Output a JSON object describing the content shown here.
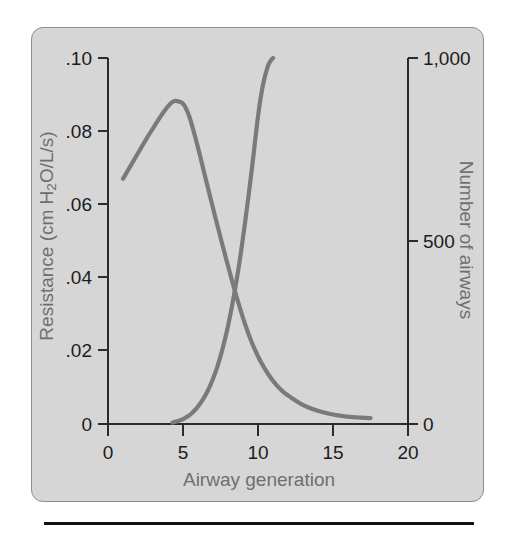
{
  "figure": {
    "panel_background": "#d6d6d6",
    "panel_border_color": "#8d8d8d",
    "curve_color": "#7a7a7a",
    "axis_color": "#2b2b2b",
    "label_color": "#6f6f6f"
  },
  "chart_data": {
    "type": "line",
    "title": "",
    "subtitle": "",
    "xlabel": "Airway generation",
    "ylabel": "Resistance (cm H2O/L/s)",
    "y2label": "Number of airways",
    "xlim": [
      0,
      20
    ],
    "ylim": [
      0,
      0.1
    ],
    "y2lim": [
      0,
      1000
    ],
    "grid": false,
    "legend": "none",
    "xticks": [
      0,
      5,
      10,
      15,
      20
    ],
    "xticklabels": [
      "0",
      "5",
      "10",
      "15",
      "20"
    ],
    "yticks": [
      0,
      0.02,
      0.04,
      0.06,
      0.08,
      0.1
    ],
    "yticklabels": [
      "0",
      ".02",
      ".04",
      ".06",
      ".08",
      ".10"
    ],
    "y2ticks": [
      0,
      500,
      1000
    ],
    "y2ticklabels": [
      "0",
      "500",
      "1,000"
    ],
    "series": [
      {
        "name": "Resistance",
        "axis": "left",
        "units": "cm H2O/L/s",
        "x": [
          1.0,
          1.5,
          2.0,
          2.5,
          3.0,
          3.5,
          4.0,
          4.4,
          4.8,
          5.0,
          5.2,
          5.5,
          6.0,
          6.5,
          7.0,
          7.5,
          8.0,
          8.5,
          9.0,
          9.5,
          10.0,
          10.5,
          11.0,
          11.5,
          12.0,
          13.0,
          14.0,
          15.0,
          16.0,
          17.0,
          17.5
        ],
        "y": [
          0.067,
          0.0705,
          0.074,
          0.0775,
          0.0808,
          0.084,
          0.0868,
          0.0882,
          0.088,
          0.0875,
          0.0862,
          0.083,
          0.0755,
          0.0672,
          0.059,
          0.051,
          0.0432,
          0.0358,
          0.029,
          0.0232,
          0.0185,
          0.0148,
          0.0118,
          0.0095,
          0.0078,
          0.0052,
          0.0036,
          0.0026,
          0.002,
          0.0017,
          0.0016
        ]
      },
      {
        "name": "Number of airways",
        "axis": "right",
        "units": "airways",
        "x": [
          4.3,
          4.8,
          5.2,
          5.6,
          6.0,
          6.4,
          6.8,
          7.2,
          7.6,
          8.0,
          8.4,
          8.8,
          9.2,
          9.6,
          10.0,
          10.3,
          10.6,
          10.8,
          11.0
        ],
        "y": [
          4,
          10,
          18,
          30,
          48,
          72,
          104,
          146,
          200,
          268,
          352,
          452,
          570,
          700,
          840,
          920,
          970,
          990,
          1000
        ]
      }
    ],
    "annotations": [
      {
        "text": "curves cross near generation 9",
        "x": 9.0,
        "y_left": 0.0225,
        "y_right": 225
      }
    ]
  },
  "axes": {
    "x": {
      "label": "Airway generation",
      "ticks": [
        "0",
        "5",
        "10",
        "15",
        "20"
      ]
    },
    "y_left": {
      "label_prefix": "Resistance (cm H",
      "label_sub": "2",
      "label_suffix": "O/L/s)",
      "ticks": [
        ".10",
        ".08",
        ".06",
        ".04",
        ".02",
        "0"
      ]
    },
    "y_right": {
      "label": "Number of airways",
      "ticks": [
        "1,000",
        "500",
        "0"
      ]
    }
  }
}
